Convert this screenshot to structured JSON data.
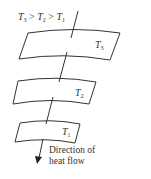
{
  "diagram": {
    "condition": {
      "t3": "T",
      "t3_sub": "3",
      "gt1": " > ",
      "t2": "T",
      "t2_sub": "2",
      "gt2": " > ",
      "t1": "T",
      "t1_sub": "1"
    },
    "plates": [
      {
        "name": "T",
        "sub": "3"
      },
      {
        "name": "T",
        "sub": "2"
      },
      {
        "name": "T",
        "sub": "1"
      }
    ],
    "arrow_label_line1": "Direction of",
    "arrow_label_line2": "heat flow",
    "line_color": "#333333"
  }
}
